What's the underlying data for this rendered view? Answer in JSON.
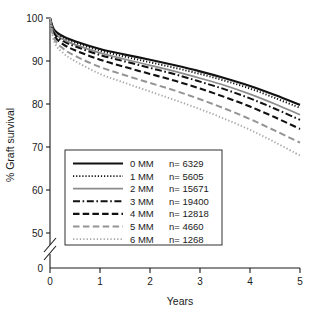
{
  "chart_data": {
    "type": "line",
    "title": "",
    "subtitle": "",
    "xlabel": "Years",
    "ylabel": "% Graft survival",
    "xlim": [
      0,
      5
    ],
    "ylim": [
      50,
      100
    ],
    "y_axis_break": true,
    "y_break_base_label": "0",
    "grid": false,
    "legend_position": "inside-lower-left",
    "xticks": [
      0,
      1,
      2,
      3,
      4,
      5
    ],
    "xtick_labels": [
      "0",
      "1",
      "2",
      "3",
      "4",
      "5"
    ],
    "yticks": [
      50,
      60,
      70,
      80,
      90,
      100
    ],
    "ytick_labels": [
      "50",
      "60",
      "70",
      "80",
      "90",
      "100"
    ],
    "x": [
      0,
      0.08,
      0.25,
      0.5,
      1,
      1.5,
      2,
      2.5,
      3,
      3.5,
      4,
      4.5,
      5
    ],
    "series": [
      {
        "name": "0 MM",
        "label": "0 MM",
        "n_label": "n= 6329",
        "n": 6329,
        "style": "solid",
        "color": "#111111",
        "width": 2.2,
        "dash": "",
        "values": [
          100,
          97.3,
          95.8,
          94.6,
          92.8,
          91.5,
          90.3,
          89.0,
          87.6,
          86.0,
          84.2,
          82.1,
          79.8
        ]
      },
      {
        "name": "1 MM",
        "label": "1 MM",
        "n_label": "n= 5605",
        "n": 5605,
        "style": "dotted",
        "color": "#111111",
        "width": 1.9,
        "dash": "1.2 1.9",
        "values": [
          100,
          97.0,
          95.4,
          94.2,
          92.4,
          91.0,
          89.7,
          88.4,
          87.0,
          85.4,
          83.6,
          81.4,
          79.1
        ]
      },
      {
        "name": "2 MM",
        "label": "2 MM",
        "n_label": "n= 15671",
        "n": 15671,
        "style": "solid",
        "color": "#8c8c8c",
        "width": 1.7,
        "dash": "",
        "values": [
          100,
          96.8,
          95.1,
          93.8,
          91.9,
          90.4,
          89.0,
          87.6,
          86.0,
          84.3,
          82.3,
          80.0,
          77.5
        ]
      },
      {
        "name": "3 MM",
        "label": "3 MM",
        "n_label": "n= 19400",
        "n": 19400,
        "style": "dashdot",
        "color": "#111111",
        "width": 2.0,
        "dash": "7 2.6 1.6 2.6",
        "values": [
          100,
          96.5,
          94.7,
          93.4,
          91.4,
          89.9,
          88.4,
          86.9,
          85.2,
          83.4,
          81.3,
          78.9,
          76.3
        ]
      },
      {
        "name": "4 MM",
        "label": "4 MM",
        "n_label": "n= 12818",
        "n": 12818,
        "style": "dashed",
        "color": "#111111",
        "width": 2.1,
        "dash": "6.5 3.2",
        "values": [
          100,
          96.0,
          94.0,
          92.5,
          90.3,
          88.6,
          87.0,
          85.4,
          83.6,
          81.6,
          79.4,
          76.9,
          74.2
        ]
      },
      {
        "name": "5 MM",
        "label": "5 MM",
        "n_label": "n= 4660",
        "n": 4660,
        "style": "dashed",
        "color": "#949494",
        "width": 2.0,
        "dash": "6.5 3.4",
        "values": [
          100,
          95.3,
          93.0,
          91.2,
          88.6,
          86.7,
          84.9,
          83.1,
          81.1,
          78.9,
          76.5,
          73.8,
          71.0
        ]
      },
      {
        "name": "6 MM",
        "label": "6 MM",
        "n_label": "n= 1268",
        "n": 1268,
        "style": "dotted",
        "color": "#a8a8a8",
        "width": 1.9,
        "dash": "1.3 2.1",
        "values": [
          100,
          94.6,
          92.0,
          90.0,
          87.0,
          84.9,
          82.9,
          80.9,
          78.8,
          76.5,
          74.0,
          71.1,
          68.0
        ]
      }
    ]
  },
  "axes": {
    "ylabel": "% Graft survival",
    "xlabel": "Years"
  }
}
